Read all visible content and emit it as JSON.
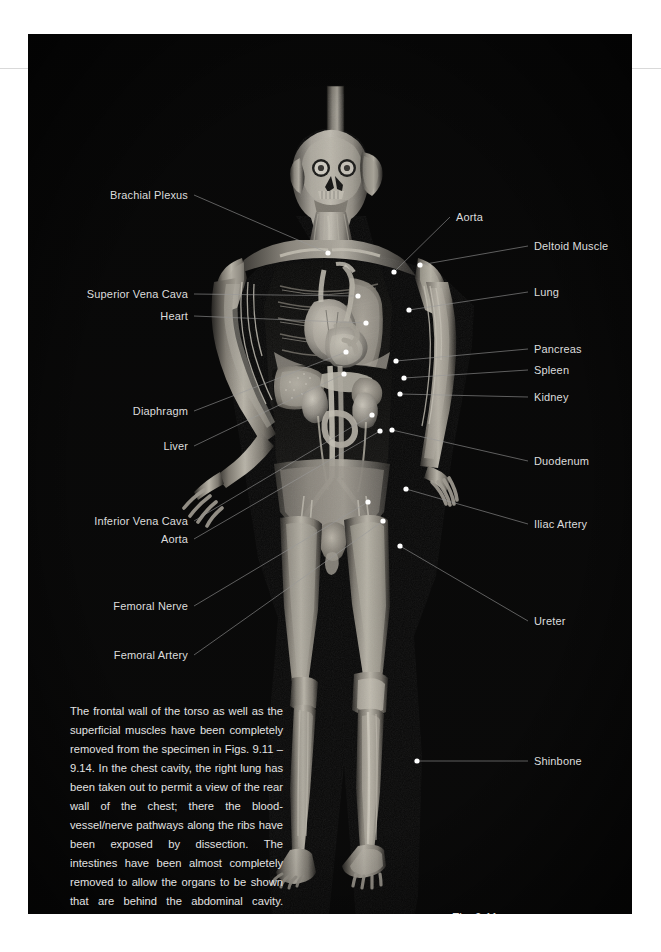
{
  "page": {
    "background": "#ffffff",
    "plate_background": "#050505",
    "label_color": "#dcdcdc",
    "leader_color": "#9a9a9a",
    "marker_color": "#ffffff"
  },
  "figure": {
    "number": "Fig. 9.11",
    "alt": "Plastinated whole-body specimen, anterior view, frontal torso wall and superficial muscles removed"
  },
  "labels_left": [
    {
      "text": "Brachial Plexus",
      "x": 160,
      "y": 161,
      "tx": 300,
      "ty": 219,
      "dot": true
    },
    {
      "text": "Superior Vena Cava",
      "x": 160,
      "y": 260,
      "tx": 330,
      "ty": 262,
      "dot": true
    },
    {
      "text": "Heart",
      "x": 160,
      "y": 282,
      "tx": 338,
      "ty": 289,
      "dot": true
    },
    {
      "text": "Diaphragm",
      "x": 160,
      "y": 377,
      "tx": 318,
      "ty": 318,
      "dot": true
    },
    {
      "text": "Liver",
      "x": 160,
      "y": 412,
      "tx": 316,
      "ty": 340,
      "dot": true
    },
    {
      "text": "Inferior Vena Cava",
      "x": 160,
      "y": 487,
      "tx": 344,
      "ty": 381,
      "dot": true
    },
    {
      "text": "Aorta",
      "x": 160,
      "y": 505,
      "tx": 352,
      "ty": 397,
      "dot": true
    },
    {
      "text": "Femoral Nerve",
      "x": 160,
      "y": 572,
      "tx": 340,
      "ty": 468,
      "dot": true
    },
    {
      "text": "Femoral Artery",
      "x": 160,
      "y": 621,
      "tx": 355,
      "ty": 487,
      "dot": true
    }
  ],
  "labels_right": [
    {
      "text": "Aorta",
      "x": 428,
      "y": 183,
      "tx": 366,
      "ty": 238,
      "dot": true
    },
    {
      "text": "Deltoid Muscle",
      "x": 506,
      "y": 212,
      "tx": 392,
      "ty": 231,
      "dot": true
    },
    {
      "text": "Lung",
      "x": 506,
      "y": 258,
      "tx": 381,
      "ty": 276,
      "dot": true
    },
    {
      "text": "Pancreas",
      "x": 506,
      "y": 315,
      "tx": 368,
      "ty": 327,
      "dot": true
    },
    {
      "text": "Spleen",
      "x": 506,
      "y": 336,
      "tx": 376,
      "ty": 344,
      "dot": true
    },
    {
      "text": "Kidney",
      "x": 506,
      "y": 363,
      "tx": 372,
      "ty": 360,
      "dot": true
    },
    {
      "text": "Duodenum",
      "x": 506,
      "y": 427,
      "tx": 364,
      "ty": 396,
      "dot": true
    },
    {
      "text": "Iliac Artery",
      "x": 506,
      "y": 490,
      "tx": 378,
      "ty": 455,
      "dot": true
    },
    {
      "text": "Ureter",
      "x": 506,
      "y": 587,
      "tx": 372,
      "ty": 512,
      "dot": true
    },
    {
      "text": "Shinbone",
      "x": 506,
      "y": 727,
      "tx": 389,
      "ty": 727,
      "dot": true
    }
  ],
  "caption": {
    "text": "The frontal wall of the torso as well as the superficial muscles have been completely removed from the specimen in Figs. 9.11 – 9.14. In the chest cavity, the right lung has been taken out to permit a view of the rear wall of the chest; there the blood-vessel/nerve pathways along the ribs have been exposed by dissection. The intestines have been almost completely removed to allow the organs to be shown that are behind the abdominal cavity. These include the kidneys and ureters, the pancreas and the duodenum as well as the aorta and the inferior vena cava."
  }
}
